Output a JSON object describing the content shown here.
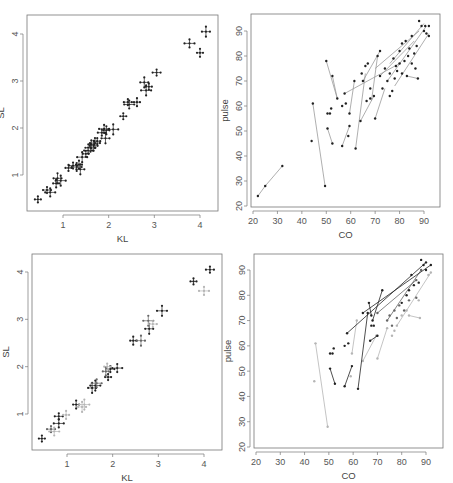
{
  "figure": {
    "layout": "2x2 grid of scatter panels"
  },
  "colors": {
    "axis": "#777777",
    "ink_dark": "#222222",
    "ink_mid": "#666666",
    "ink_light": "#b5b5b5",
    "segment": "#9a9a9a",
    "background": "#ffffff"
  },
  "chart_data": [
    {
      "id": "panel-top-left",
      "type": "scatter",
      "title": "",
      "xlabel": "KL",
      "ylabel": "SL",
      "xlim": [
        0.3,
        4.3
      ],
      "ylim": [
        0.3,
        4.4
      ],
      "xticks": [
        1,
        2,
        3,
        4
      ],
      "yticks": [
        1,
        2,
        3,
        4
      ],
      "grid": false,
      "marker": "crosshair",
      "points": [
        {
          "x": 0.45,
          "y": 0.48
        },
        {
          "x": 0.65,
          "y": 0.68
        },
        {
          "x": 0.72,
          "y": 0.63
        },
        {
          "x": 0.85,
          "y": 0.82
        },
        {
          "x": 0.88,
          "y": 0.93
        },
        {
          "x": 0.95,
          "y": 0.88
        },
        {
          "x": 1.12,
          "y": 1.15
        },
        {
          "x": 1.22,
          "y": 1.2
        },
        {
          "x": 1.3,
          "y": 1.17
        },
        {
          "x": 1.35,
          "y": 1.22
        },
        {
          "x": 1.38,
          "y": 1.12
        },
        {
          "x": 1.42,
          "y": 1.38
        },
        {
          "x": 1.5,
          "y": 1.45
        },
        {
          "x": 1.55,
          "y": 1.52
        },
        {
          "x": 1.6,
          "y": 1.58
        },
        {
          "x": 1.62,
          "y": 1.65
        },
        {
          "x": 1.67,
          "y": 1.62
        },
        {
          "x": 1.7,
          "y": 1.68
        },
        {
          "x": 1.75,
          "y": 1.72
        },
        {
          "x": 1.85,
          "y": 1.9
        },
        {
          "x": 1.9,
          "y": 1.98
        },
        {
          "x": 1.95,
          "y": 1.95
        },
        {
          "x": 1.93,
          "y": 1.78
        },
        {
          "x": 2.1,
          "y": 1.97
        },
        {
          "x": 2.32,
          "y": 2.25
        },
        {
          "x": 2.42,
          "y": 2.55
        },
        {
          "x": 2.45,
          "y": 2.5
        },
        {
          "x": 2.62,
          "y": 2.55
        },
        {
          "x": 2.78,
          "y": 2.97
        },
        {
          "x": 2.82,
          "y": 2.8
        },
        {
          "x": 2.88,
          "y": 2.88
        },
        {
          "x": 3.05,
          "y": 3.18
        },
        {
          "x": 3.77,
          "y": 3.8
        },
        {
          "x": 4.0,
          "y": 3.6
        },
        {
          "x": 4.13,
          "y": 4.05
        }
      ]
    },
    {
      "id": "panel-top-right",
      "type": "scatter",
      "title": "",
      "xlabel": "CO",
      "ylabel": "pulse",
      "xlim": [
        20,
        96
      ],
      "ylim": [
        20,
        97
      ],
      "xticks": [
        20,
        30,
        40,
        50,
        60,
        70,
        80,
        90
      ],
      "yticks": [
        20,
        30,
        40,
        50,
        60,
        70,
        80,
        90
      ],
      "grid": false,
      "marker": "dot-with-connecting-segments",
      "segments": [
        [
          {
            "x": 22,
            "y": 24
          },
          {
            "x": 25,
            "y": 28
          }
        ],
        [
          {
            "x": 25,
            "y": 28
          },
          {
            "x": 32,
            "y": 36
          }
        ],
        [
          {
            "x": 44.5,
            "y": 61
          },
          {
            "x": 49.5,
            "y": 28
          }
        ],
        [
          {
            "x": 50,
            "y": 78
          },
          {
            "x": 54.5,
            "y": 63
          }
        ],
        [
          {
            "x": 52.5,
            "y": 72
          },
          {
            "x": 54.5,
            "y": 63
          }
        ],
        [
          {
            "x": 50.5,
            "y": 51
          },
          {
            "x": 52.5,
            "y": 45
          }
        ],
        [
          {
            "x": 56.5,
            "y": 44
          },
          {
            "x": 59.5,
            "y": 52
          }
        ],
        [
          {
            "x": 59.5,
            "y": 57
          },
          {
            "x": 61.5,
            "y": 70
          }
        ],
        [
          {
            "x": 62,
            "y": 43
          },
          {
            "x": 66,
            "y": 73
          }
        ],
        [
          {
            "x": 64,
            "y": 54
          },
          {
            "x": 69.5,
            "y": 64
          }
        ],
        [
          {
            "x": 57.5,
            "y": 65
          },
          {
            "x": 80,
            "y": 77
          }
        ],
        [
          {
            "x": 65,
            "y": 70
          },
          {
            "x": 72,
            "y": 82
          }
        ],
        [
          {
            "x": 68.5,
            "y": 62
          },
          {
            "x": 71,
            "y": 80
          }
        ],
        [
          {
            "x": 70,
            "y": 55
          },
          {
            "x": 74,
            "y": 67
          }
        ],
        [
          {
            "x": 83,
            "y": 72
          },
          {
            "x": 87.5,
            "y": 71
          }
        ],
        [
          {
            "x": 70,
            "y": 75
          },
          {
            "x": 88,
            "y": 90
          }
        ],
        [
          {
            "x": 75,
            "y": 70
          },
          {
            "x": 91,
            "y": 92
          }
        ],
        [
          {
            "x": 78,
            "y": 68
          },
          {
            "x": 92,
            "y": 89
          }
        ],
        [
          {
            "x": 72,
            "y": 72
          },
          {
            "x": 86,
            "y": 86
          }
        ],
        [
          {
            "x": 76,
            "y": 77
          },
          {
            "x": 90,
            "y": 93
          }
        ]
      ],
      "points": [
        {
          "x": 22,
          "y": 24
        },
        {
          "x": 25,
          "y": 28
        },
        {
          "x": 32,
          "y": 36
        },
        {
          "x": 44,
          "y": 46
        },
        {
          "x": 44.5,
          "y": 61
        },
        {
          "x": 49.5,
          "y": 28
        },
        {
          "x": 50,
          "y": 78
        },
        {
          "x": 52.5,
          "y": 72
        },
        {
          "x": 54.5,
          "y": 63
        },
        {
          "x": 50.5,
          "y": 57
        },
        {
          "x": 52,
          "y": 59
        },
        {
          "x": 51.5,
          "y": 57
        },
        {
          "x": 50.5,
          "y": 51
        },
        {
          "x": 52.5,
          "y": 45
        },
        {
          "x": 56.5,
          "y": 44
        },
        {
          "x": 57.5,
          "y": 65
        },
        {
          "x": 56.5,
          "y": 60
        },
        {
          "x": 58,
          "y": 61
        },
        {
          "x": 59,
          "y": 48
        },
        {
          "x": 59.5,
          "y": 52
        },
        {
          "x": 59.5,
          "y": 57
        },
        {
          "x": 61.5,
          "y": 70
        },
        {
          "x": 62,
          "y": 43
        },
        {
          "x": 64,
          "y": 54
        },
        {
          "x": 64.5,
          "y": 73
        },
        {
          "x": 65,
          "y": 70
        },
        {
          "x": 66,
          "y": 76
        },
        {
          "x": 67,
          "y": 77
        },
        {
          "x": 66.5,
          "y": 62
        },
        {
          "x": 68,
          "y": 63
        },
        {
          "x": 68,
          "y": 67
        },
        {
          "x": 69.5,
          "y": 64
        },
        {
          "x": 70,
          "y": 55
        },
        {
          "x": 71,
          "y": 80
        },
        {
          "x": 72,
          "y": 82
        },
        {
          "x": 72,
          "y": 72
        },
        {
          "x": 73,
          "y": 67
        },
        {
          "x": 74,
          "y": 75
        },
        {
          "x": 75,
          "y": 70
        },
        {
          "x": 76,
          "y": 64
        },
        {
          "x": 76,
          "y": 73
        },
        {
          "x": 77,
          "y": 66
        },
        {
          "x": 77.5,
          "y": 79
        },
        {
          "x": 78,
          "y": 71
        },
        {
          "x": 78.5,
          "y": 76
        },
        {
          "x": 79,
          "y": 74
        },
        {
          "x": 80,
          "y": 77
        },
        {
          "x": 80,
          "y": 82
        },
        {
          "x": 81,
          "y": 73
        },
        {
          "x": 81,
          "y": 85
        },
        {
          "x": 82,
          "y": 78
        },
        {
          "x": 82.5,
          "y": 86
        },
        {
          "x": 83,
          "y": 72
        },
        {
          "x": 83.5,
          "y": 80
        },
        {
          "x": 84,
          "y": 83
        },
        {
          "x": 85,
          "y": 77
        },
        {
          "x": 85,
          "y": 88
        },
        {
          "x": 86,
          "y": 81
        },
        {
          "x": 86.5,
          "y": 75
        },
        {
          "x": 87,
          "y": 84
        },
        {
          "x": 87.5,
          "y": 71
        },
        {
          "x": 88,
          "y": 94
        },
        {
          "x": 89,
          "y": 92
        },
        {
          "x": 90,
          "y": 90
        },
        {
          "x": 90.5,
          "y": 92
        },
        {
          "x": 91,
          "y": 89
        },
        {
          "x": 92,
          "y": 92
        },
        {
          "x": 92,
          "y": 88
        }
      ]
    },
    {
      "id": "panel-bottom-left",
      "type": "scatter",
      "title": "",
      "xlabel": "KL",
      "ylabel": "SL",
      "xlim": [
        0.3,
        4.4
      ],
      "ylim": [
        0.3,
        4.4
      ],
      "xticks": [
        1,
        2,
        3,
        4
      ],
      "yticks": [
        1,
        2,
        3,
        4
      ],
      "grid": false,
      "marker": "crosshair-shaded-by-group",
      "series": [
        {
          "name": "dark",
          "points": [
            {
              "x": 0.45,
              "y": 0.48
            },
            {
              "x": 0.82,
              "y": 0.95
            },
            {
              "x": 0.82,
              "y": 0.8
            },
            {
              "x": 1.2,
              "y": 1.2
            },
            {
              "x": 1.55,
              "y": 1.55
            },
            {
              "x": 1.62,
              "y": 1.6
            },
            {
              "x": 1.9,
              "y": 1.78
            },
            {
              "x": 1.95,
              "y": 1.95
            },
            {
              "x": 2.1,
              "y": 1.97
            },
            {
              "x": 2.45,
              "y": 2.55
            },
            {
              "x": 2.8,
              "y": 2.8
            },
            {
              "x": 3.08,
              "y": 3.18
            },
            {
              "x": 3.77,
              "y": 3.8
            },
            {
              "x": 4.13,
              "y": 4.05
            }
          ]
        },
        {
          "name": "mid",
          "points": [
            {
              "x": 0.65,
              "y": 0.68
            },
            {
              "x": 1.65,
              "y": 1.65
            },
            {
              "x": 1.85,
              "y": 1.9
            },
            {
              "x": 2.62,
              "y": 2.55
            },
            {
              "x": 2.78,
              "y": 2.97
            }
          ]
        },
        {
          "name": "light",
          "points": [
            {
              "x": 0.72,
              "y": 0.63
            },
            {
              "x": 0.98,
              "y": 0.98
            },
            {
              "x": 1.33,
              "y": 1.15
            },
            {
              "x": 1.38,
              "y": 1.2
            },
            {
              "x": 1.88,
              "y": 2.0
            },
            {
              "x": 2.88,
              "y": 2.9
            },
            {
              "x": 4.0,
              "y": 3.6
            }
          ]
        }
      ]
    },
    {
      "id": "panel-bottom-right",
      "type": "scatter",
      "title": "",
      "xlabel": "CO",
      "ylabel": "pulse",
      "xlim": [
        19,
        96
      ],
      "ylim": [
        20,
        97
      ],
      "xticks": [
        20,
        30,
        40,
        50,
        60,
        70,
        80,
        90
      ],
      "yticks": [
        20,
        30,
        40,
        50,
        60,
        70,
        80,
        90
      ],
      "grid": false,
      "marker": "dot-with-segments-shaded-by-group",
      "series": [
        {
          "name": "dark",
          "segments": [
            [
              {
                "x": 50.5,
                "y": 51
              },
              {
                "x": 52.5,
                "y": 45
              }
            ],
            [
              {
                "x": 56.5,
                "y": 44
              },
              {
                "x": 59.5,
                "y": 52
              }
            ],
            [
              {
                "x": 62,
                "y": 43
              },
              {
                "x": 66,
                "y": 73
              }
            ],
            [
              {
                "x": 57.5,
                "y": 65
              },
              {
                "x": 90,
                "y": 93
              }
            ],
            [
              {
                "x": 64,
                "y": 73
              },
              {
                "x": 92,
                "y": 92
              }
            ],
            [
              {
                "x": 67,
                "y": 62
              },
              {
                "x": 70,
                "y": 64
              }
            ],
            [
              {
                "x": 66.5,
                "y": 77
              },
              {
                "x": 67.5,
                "y": 72
              }
            ],
            [
              {
                "x": 72,
                "y": 82
              },
              {
                "x": 68,
                "y": 70
              }
            ]
          ],
          "points": [
            {
              "x": 50.5,
              "y": 57
            },
            {
              "x": 52,
              "y": 59
            },
            {
              "x": 51.5,
              "y": 57
            },
            {
              "x": 56.5,
              "y": 60
            },
            {
              "x": 58,
              "y": 61
            },
            {
              "x": 67.5,
              "y": 68
            },
            {
              "x": 68.5,
              "y": 68
            },
            {
              "x": 80,
              "y": 77
            },
            {
              "x": 82,
              "y": 80
            },
            {
              "x": 85,
              "y": 84
            },
            {
              "x": 88,
              "y": 94
            },
            {
              "x": 90,
              "y": 90
            },
            {
              "x": 89,
              "y": 92
            },
            {
              "x": 87,
              "y": 85
            },
            {
              "x": 84,
              "y": 88
            },
            {
              "x": 83,
              "y": 82
            }
          ]
        },
        {
          "name": "mid",
          "segments": [
            [
              {
                "x": 70,
                "y": 73
              },
              {
                "x": 86,
                "y": 86
              }
            ],
            [
              {
                "x": 74,
                "y": 70
              },
              {
                "x": 88,
                "y": 90
              }
            ]
          ],
          "points": [
            {
              "x": 75,
              "y": 72
            },
            {
              "x": 76,
              "y": 68
            },
            {
              "x": 77,
              "y": 74
            },
            {
              "x": 78,
              "y": 71
            },
            {
              "x": 79,
              "y": 76
            },
            {
              "x": 81,
              "y": 74
            },
            {
              "x": 83,
              "y": 78
            },
            {
              "x": 86,
              "y": 79
            }
          ]
        },
        {
          "name": "light",
          "segments": [
            [
              {
                "x": 44.5,
                "y": 61
              },
              {
                "x": 49.5,
                "y": 28
              }
            ],
            [
              {
                "x": 59.5,
                "y": 57
              },
              {
                "x": 61.5,
                "y": 70
              }
            ],
            [
              {
                "x": 64,
                "y": 54
              },
              {
                "x": 69.5,
                "y": 64
              }
            ],
            [
              {
                "x": 70,
                "y": 55
              },
              {
                "x": 74,
                "y": 67
              }
            ],
            [
              {
                "x": 83,
                "y": 72
              },
              {
                "x": 87.5,
                "y": 71
              }
            ],
            [
              {
                "x": 78,
                "y": 68
              },
              {
                "x": 92,
                "y": 89
              }
            ]
          ],
          "points": [
            {
              "x": 44,
              "y": 46
            },
            {
              "x": 59,
              "y": 48
            },
            {
              "x": 76,
              "y": 64
            },
            {
              "x": 77,
              "y": 66
            },
            {
              "x": 80,
              "y": 72
            },
            {
              "x": 82,
              "y": 74
            },
            {
              "x": 87,
              "y": 78
            },
            {
              "x": 91,
              "y": 88
            }
          ]
        }
      ]
    }
  ]
}
